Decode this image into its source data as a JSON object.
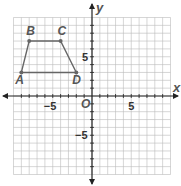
{
  "chart_data": {
    "type": "scatter",
    "title": "",
    "xlabel": "x",
    "ylabel": "y",
    "origin_label": "O",
    "xlim": [
      -10,
      10
    ],
    "ylim": [
      -10,
      10
    ],
    "grid": true,
    "x_tick_labels": [
      {
        "value": -5,
        "label": "−5"
      },
      {
        "value": 5,
        "label": "5"
      }
    ],
    "y_tick_labels": [
      {
        "value": 5,
        "label": "5"
      },
      {
        "value": -5,
        "label": "−5"
      }
    ],
    "points": [
      {
        "name": "A",
        "x": -9,
        "y": 3
      },
      {
        "name": "B",
        "x": -8,
        "y": 7
      },
      {
        "name": "C",
        "x": -4,
        "y": 7
      },
      {
        "name": "D",
        "x": -2,
        "y": 3
      }
    ],
    "polygon": [
      "A",
      "B",
      "C",
      "D"
    ],
    "colors": {
      "shape": "#666666",
      "grid": "#bbbbbb",
      "axis": "#222222"
    }
  }
}
